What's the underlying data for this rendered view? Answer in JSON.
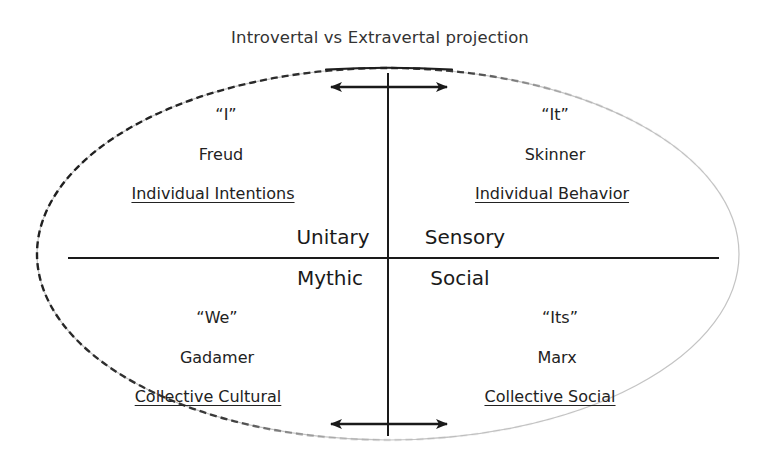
{
  "diagram": {
    "title": "Introvertal vs Extravertal projection",
    "quadrants": {
      "top_left": {
        "pronoun": "“I”",
        "thinker": "Freud",
        "label": "Individual Intentions"
      },
      "top_right": {
        "pronoun": "“It”",
        "thinker": "Skinner",
        "label": "Individual Behavior"
      },
      "bottom_left": {
        "pronoun": "“We”",
        "thinker": "Gadamer",
        "label": "Collective Cultural"
      },
      "bottom_right": {
        "pronoun": "“Its”",
        "thinker": "Marx",
        "label": "Collective Social"
      }
    },
    "center_labels": {
      "top_left": "Unitary",
      "top_right": "Sensory",
      "bottom_left": "Mythic",
      "bottom_right": "Social"
    },
    "shapes": {
      "outline": "ellipse",
      "axes": [
        "horizontal-axis",
        "vertical-axis"
      ],
      "arrows": [
        "double-arrow-top",
        "double-arrow-bottom"
      ]
    },
    "colors": {
      "text": "#1e1e1e",
      "title": "#333333",
      "lines": "#1a1a1a",
      "ellipse_dark": "#222222",
      "ellipse_light": "#c4c4c4"
    }
  }
}
